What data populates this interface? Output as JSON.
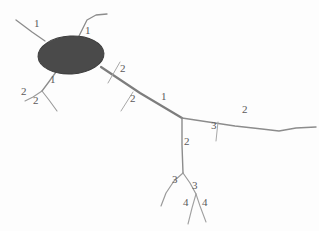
{
  "figure": {
    "background_color": "#fdfdfd",
    "soma": {
      "name": "soma",
      "shape": "ellipse",
      "cx": 71,
      "cy": 55,
      "rx": 33,
      "ry": 19,
      "rotation_deg": -3,
      "fill_color": "#4a4a4a",
      "stroke_color": "#3d3d3d"
    },
    "stroke_colors": {
      "primary_neurite": "#808080",
      "thin_neurite": "#9a9a9a",
      "tick_mark": "#a8a8a8"
    },
    "neurites": [
      {
        "name": "dendrite-upper-left",
        "order": "1",
        "width": 1.3,
        "color": "#8c8c8c",
        "points": "16,20 32,32 45,41"
      },
      {
        "name": "dendrite-top",
        "order": "1",
        "width": 1.3,
        "color": "#8c8c8c",
        "points": "78,38 87,20 96,15 107,14"
      },
      {
        "name": "dendrite-lower-left-stem",
        "order": "1",
        "width": 1.3,
        "color": "#8c8c8c",
        "points": "56,72 48,83 42,91"
      },
      {
        "name": "dendrite-lower-left-branch-a",
        "order": "2",
        "width": 1.1,
        "color": "#9a9a9a",
        "points": "42,91 33,97 25,101"
      },
      {
        "name": "dendrite-lower-left-branch-b",
        "order": "2",
        "width": 1.1,
        "color": "#9a9a9a",
        "points": "42,91 49,100 57,111"
      },
      {
        "name": "axon-main-trunk",
        "order": "1",
        "width": 2.2,
        "color": "#7d7d7d",
        "points": "101,67 140,93 182,118"
      },
      {
        "name": "axon-right-branch",
        "order": "2",
        "width": 1.4,
        "color": "#8c8c8c",
        "points": "182,118 235,126 262,129 279,131 296,128 316,127"
      },
      {
        "name": "axon-descending-trunk",
        "order": "2",
        "width": 1.4,
        "color": "#8c8c8c",
        "points": "182,118 182,145 183,173"
      },
      {
        "name": "axon-lower-branch-left",
        "order": "3",
        "width": 1.2,
        "color": "#9a9a9a",
        "points": "183,173 174,181 166,193 161,206"
      },
      {
        "name": "axon-lower-branch-right",
        "order": "3",
        "width": 1.2,
        "color": "#9a9a9a",
        "points": "183,173 190,183 196,194"
      },
      {
        "name": "axon-terminal-branch-left",
        "order": "4",
        "width": 1.1,
        "color": "#a0a0a0",
        "points": "196,194 200,206 206,222"
      },
      {
        "name": "axon-terminal-branch-right",
        "order": "4",
        "width": 1.1,
        "color": "#a0a0a0",
        "points": "196,194 192,208 188,224"
      }
    ],
    "tick_marks": [
      {
        "name": "tick-axon-upper",
        "points": "108,83 120,62",
        "width": 1.0,
        "color": "#a8a8a8"
      },
      {
        "name": "tick-axon-lower",
        "points": "121,111 133,92",
        "width": 1.0,
        "color": "#a8a8a8"
      },
      {
        "name": "tick-right-branch",
        "points": "216,141 218,122",
        "width": 1.0,
        "color": "#a8a8a8"
      }
    ],
    "labels": [
      {
        "name": "order-label-dendrite-upper-left",
        "text": "1",
        "x": 34,
        "y": 18
      },
      {
        "name": "order-label-dendrite-top",
        "text": "1",
        "x": 85,
        "y": 25
      },
      {
        "name": "order-label-dendrite-lower-left-stem",
        "text": "1",
        "x": 50,
        "y": 74
      },
      {
        "name": "order-label-branch-2a",
        "text": "2",
        "x": 21,
        "y": 86
      },
      {
        "name": "order-label-branch-2b",
        "text": "2",
        "x": 33,
        "y": 95
      },
      {
        "name": "order-label-axon-tick-upper",
        "text": "2",
        "x": 120,
        "y": 63
      },
      {
        "name": "order-label-axon-tick-lower",
        "text": "2",
        "x": 130,
        "y": 93
      },
      {
        "name": "order-label-axon-trunk",
        "text": "1",
        "x": 161,
        "y": 91
      },
      {
        "name": "order-label-right-branch",
        "text": "2",
        "x": 242,
        "y": 104
      },
      {
        "name": "order-label-right-branch-tick",
        "text": "3",
        "x": 211,
        "y": 120
      },
      {
        "name": "order-label-descending-trunk",
        "text": "2",
        "x": 184,
        "y": 136
      },
      {
        "name": "order-label-lower-branch-left",
        "text": "3",
        "x": 172,
        "y": 174
      },
      {
        "name": "order-label-lower-branch-right",
        "text": "3",
        "x": 192,
        "y": 180
      },
      {
        "name": "order-label-terminal-left",
        "text": "4",
        "x": 183,
        "y": 197
      },
      {
        "name": "order-label-terminal-right",
        "text": "4",
        "x": 202,
        "y": 197
      }
    ]
  }
}
